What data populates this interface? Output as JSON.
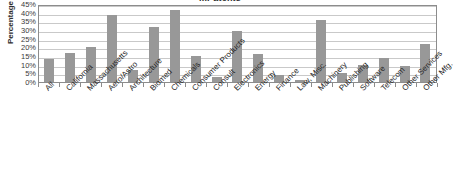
{
  "chart_data": {
    "type": "bar",
    "title": "...Patents",
    "xlabel": "",
    "ylabel": "Percentage",
    "ylim": [
      0,
      45
    ],
    "ytick_labels": [
      "45%",
      "40%",
      "35%",
      "30%",
      "25%",
      "20%",
      "15%",
      "10%",
      "5%",
      "0%"
    ],
    "ytick_values": [
      45,
      40,
      35,
      30,
      25,
      20,
      15,
      10,
      5,
      0
    ],
    "grid": true,
    "legend": null,
    "series_color": "#989898",
    "categories": [
      "All",
      "California",
      "Massachusetts",
      "Aero/Astro",
      "Architecture",
      "Biomed",
      "Chemicals",
      "Consumer Products",
      "Consult",
      "Electronics",
      "Energy",
      "Finance",
      "Law, Misc.",
      "Machinery",
      "Publishing",
      "Software",
      "Telecom",
      "Other Services",
      "Other Mfg."
    ],
    "values": [
      13.5,
      16.5,
      20,
      38.5,
      7,
      32,
      41.5,
      15,
      3,
      29.5,
      16,
      4,
      1,
      36,
      5,
      10,
      14,
      9,
      22
    ],
    "value_labels": [
      "13.5%",
      "16.5%",
      "20%",
      "38.5%",
      "7%",
      "32%",
      "41.5%",
      "15%",
      "3%",
      "29.5%",
      "16%",
      "4%",
      "1%",
      "36%",
      "5%",
      "10%",
      "14%",
      "9%",
      "22%"
    ]
  },
  "colors": {
    "bar": "#989898",
    "gridline": "#c9c9c9",
    "frame": "#8c8c8c",
    "text": "#262626",
    "background": "#ffffff"
  }
}
